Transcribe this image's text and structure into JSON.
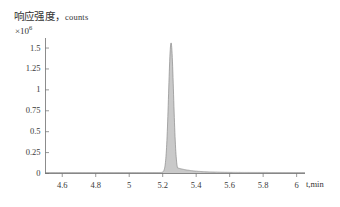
{
  "chart_data": {
    "type": "line",
    "title": "",
    "subtitle": "",
    "ylabel": "响应强度，counts",
    "ylabel_units": "counts",
    "ylabel_cn": "响应强度",
    "y_scale_prefix": "×10",
    "y_scale_exponent": "6",
    "y_scale_text": "×10⁶",
    "xlabel": "t,min",
    "xlabel_symbol": "t",
    "xlabel_unit": "min",
    "grid": false,
    "legend": "none",
    "xlim": [
      4.5,
      6.05
    ],
    "ylim": [
      0,
      1.62
    ],
    "xticks": [
      4.6,
      4.8,
      5,
      5.2,
      5.4,
      5.6,
      5.8,
      6
    ],
    "xtick_labels": [
      "4.6",
      "4.8",
      "5",
      "5.2",
      "5.4",
      "5.6",
      "5.8",
      "6"
    ],
    "yticks": [
      0,
      0.25,
      0.5,
      0.75,
      1,
      1.25,
      1.5
    ],
    "ytick_labels": [
      "0",
      "0.25",
      "0.5",
      "0.75",
      "1",
      "1.25",
      "1.5"
    ],
    "series": [
      {
        "name": "chromatogram",
        "fill_color": "#c9c9c9",
        "line_color": "#8a8a8a",
        "peaks": [
          {
            "label": "main-peak",
            "retention_time": 5.25,
            "height": 1.55,
            "width_half_max": 0.035,
            "tailing": 0.09
          }
        ],
        "baseline": 0.012,
        "x": [
          4.5,
          4.6,
          4.7,
          4.8,
          4.9,
          5.0,
          5.05,
          5.1,
          5.14,
          5.17,
          5.19,
          5.21,
          5.22,
          5.23,
          5.24,
          5.25,
          5.26,
          5.27,
          5.28,
          5.29,
          5.3,
          5.32,
          5.34,
          5.36,
          5.38,
          5.4,
          5.44,
          5.48,
          5.52,
          5.56,
          5.6,
          5.7,
          5.8,
          5.9,
          6.0,
          6.05
        ],
        "y": [
          0.012,
          0.012,
          0.013,
          0.013,
          0.014,
          0.016,
          0.018,
          0.022,
          0.032,
          0.06,
          0.12,
          0.42,
          0.74,
          1.12,
          1.42,
          1.55,
          1.48,
          1.28,
          0.98,
          0.7,
          0.48,
          0.25,
          0.14,
          0.09,
          0.065,
          0.05,
          0.036,
          0.028,
          0.024,
          0.021,
          0.019,
          0.016,
          0.015,
          0.014,
          0.013,
          0.013
        ]
      }
    ]
  },
  "axes": {
    "y_axis_name": "intensity-axis",
    "x_axis_name": "time-axis"
  }
}
